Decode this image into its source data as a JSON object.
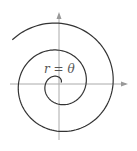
{
  "diagram": {
    "type": "polar-spiral",
    "equation_label": "r = θ",
    "origin": [
      59,
      84
    ],
    "scale_px_per_rad": 4.3,
    "theta_start": 0.6,
    "theta_end": 15.0,
    "axis_color": "#aaaaaa",
    "curve_color": "#333333"
  }
}
